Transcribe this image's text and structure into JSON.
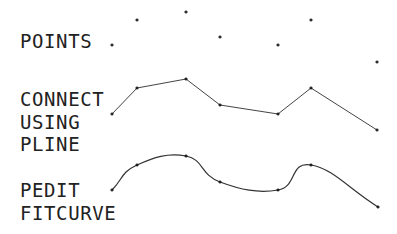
{
  "colors": {
    "background": "#ffffff",
    "ink": "#222222",
    "line": "#333333"
  },
  "labels": [
    {
      "id": "points",
      "lines": [
        "POINTS"
      ],
      "x": 21,
      "y": [
        48
      ]
    },
    {
      "id": "pline",
      "lines": [
        "CONNECT",
        "USING",
        "PLINE"
      ],
      "x": 21,
      "y": [
        106,
        129,
        151
      ]
    },
    {
      "id": "fitcurve",
      "lines": [
        "PEDIT",
        "FITCURVE"
      ],
      "x": 21,
      "y": [
        197,
        220
      ]
    }
  ],
  "rows": {
    "points": {
      "title": "POINTS",
      "vertices": [
        [
          112,
          45
        ],
        [
          137,
          20
        ],
        [
          186,
          12
        ],
        [
          220,
          37
        ],
        [
          278,
          45
        ],
        [
          311,
          20
        ],
        [
          377,
          62
        ]
      ]
    },
    "pline": {
      "title": "CONNECT USING PLINE",
      "vertices": [
        [
          112,
          114
        ],
        [
          137,
          88
        ],
        [
          186,
          79
        ],
        [
          220,
          105
        ],
        [
          278,
          114
        ],
        [
          311,
          88
        ],
        [
          377,
          130
        ]
      ]
    },
    "fitcurve": {
      "title": "PEDIT FITCURVE",
      "vertices": [
        [
          112,
          190
        ],
        [
          137,
          165
        ],
        [
          186,
          156
        ],
        [
          220,
          182
        ],
        [
          278,
          190
        ],
        [
          311,
          165
        ],
        [
          378,
          207
        ]
      ]
    }
  },
  "text": {
    "points_l1": "POINTS",
    "pline_l1": "CONNECT",
    "pline_l2": "USING",
    "pline_l3": "PLINE",
    "fit_l1": "PEDIT",
    "fit_l2": "FITCURVE"
  }
}
